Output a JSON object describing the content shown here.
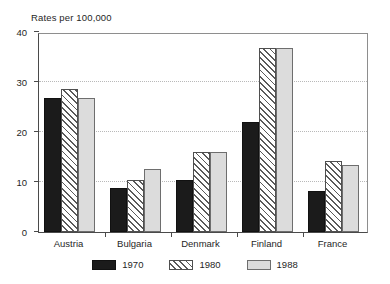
{
  "chart_data": {
    "type": "bar",
    "title": "Rates per 100,000",
    "xlabel": "",
    "ylabel": "",
    "ylim": [
      0,
      40
    ],
    "yticks": [
      0,
      10,
      20,
      30,
      40
    ],
    "ytick_labels": [
      "0",
      "10",
      "20",
      "30",
      "40"
    ],
    "gridlines": [
      10,
      20,
      30
    ],
    "grid": true,
    "legend_position": "bottom",
    "categories": [
      "Austria",
      "Bulgaria",
      "Denmark",
      "Finland",
      "France"
    ],
    "series": [
      {
        "name": "1970",
        "values": [
          26.8,
          8.8,
          10.5,
          22.0,
          8.3
        ]
      },
      {
        "name": "1980",
        "values": [
          28.6,
          10.5,
          16.0,
          36.8,
          14.2
        ]
      },
      {
        "name": "1988",
        "values": [
          26.9,
          12.6,
          16.0,
          36.8,
          13.5
        ]
      }
    ],
    "colors": {
      "series_1970": "#1b1b1b",
      "series_1980": "#ffffff",
      "series_1988": "#dcdcdc",
      "axis": "#4a4a4a",
      "grid": "#b9b9b9",
      "text": "#1f1f1f"
    }
  },
  "legend": {
    "items": [
      {
        "label": "1970"
      },
      {
        "label": "1980"
      },
      {
        "label": "1988"
      }
    ]
  }
}
